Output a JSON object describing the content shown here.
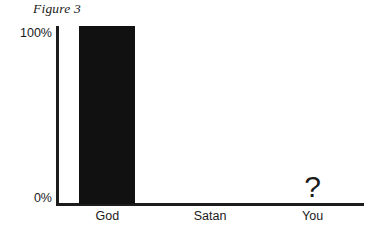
{
  "chart_data": {
    "type": "bar",
    "title": "Figure 3",
    "xlabel": "",
    "ylabel": "",
    "categories": [
      "God",
      "Satan",
      "You"
    ],
    "values": [
      100,
      0,
      null
    ],
    "value_annotations": [
      "",
      "",
      "?"
    ],
    "ylim": [
      0,
      100
    ],
    "ytick_labels": [
      "100%",
      "0%"
    ],
    "ytick_values": [
      100,
      0
    ],
    "grid": false,
    "legend": null,
    "series": [
      {
        "name": "Percent",
        "values": [
          100,
          0,
          null
        ]
      }
    ]
  },
  "style": {
    "bar_color": "#111111",
    "axis_color": "#1c1c1c",
    "text_color": "#1a1a1a",
    "background": "#ffffff"
  }
}
